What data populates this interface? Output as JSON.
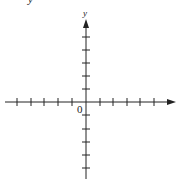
{
  "diagram": {
    "type": "coordinate-plane",
    "x_axis": {
      "label": "",
      "ticks_left": 5,
      "ticks_right": 5,
      "arrow": "right"
    },
    "y_axis": {
      "label": "y",
      "ticks_above": 5,
      "ticks_below": 5,
      "arrow": "up"
    },
    "origin_label": "0",
    "top_cut_label": "y",
    "colors": {
      "axis": "#222222",
      "background": "#ffffff"
    }
  }
}
